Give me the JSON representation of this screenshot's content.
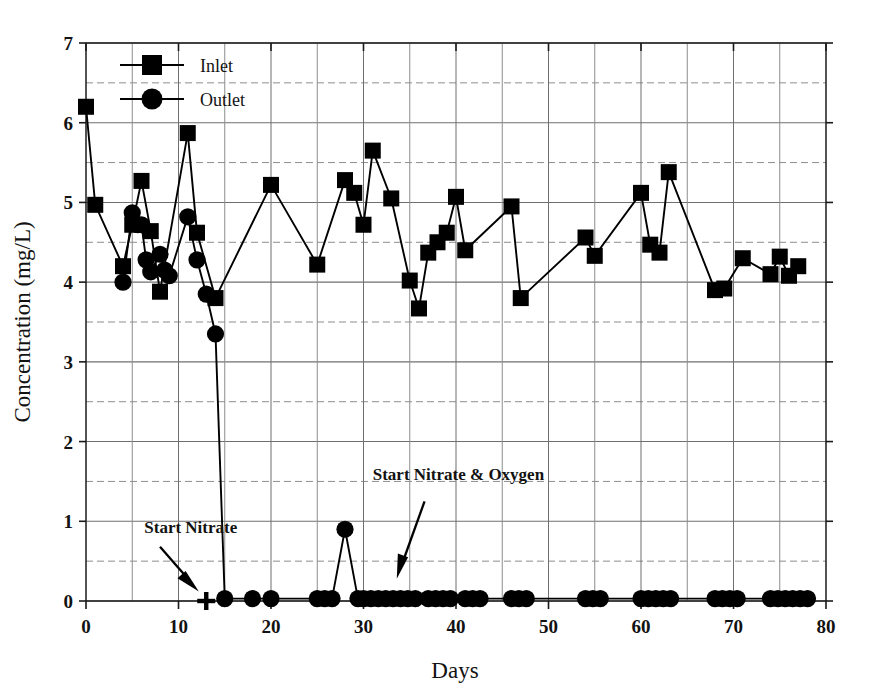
{
  "chart_data": {
    "type": "line",
    "title": "",
    "xlabel": "Days",
    "ylabel": "Concentration (mg/L)",
    "xlim": [
      0,
      80
    ],
    "ylim": [
      0,
      7
    ],
    "x_major_ticks": [
      0,
      10,
      20,
      30,
      40,
      50,
      60,
      70,
      80
    ],
    "x_minor_step": 5,
    "y_major_ticks": [
      0,
      1,
      2,
      3,
      4,
      5,
      6,
      7
    ],
    "y_minor_step": 0.5,
    "grid": "major solid, minor dashed",
    "legend_position": "top-left inside plot",
    "series": [
      {
        "name": "Inlet",
        "marker": "square",
        "color": "#000000",
        "points": [
          [
            0,
            6.2
          ],
          [
            1,
            4.97
          ],
          [
            4,
            4.2
          ],
          [
            5,
            4.72
          ],
          [
            6,
            5.27
          ],
          [
            7,
            4.64
          ],
          [
            8,
            3.88
          ],
          [
            11,
            5.87
          ],
          [
            12,
            4.62
          ],
          [
            14,
            3.8
          ],
          [
            20,
            5.22
          ],
          [
            25,
            4.22
          ],
          [
            28,
            5.28
          ],
          [
            29,
            5.12
          ],
          [
            30,
            4.72
          ],
          [
            31,
            5.65
          ],
          [
            33,
            5.05
          ],
          [
            35,
            4.02
          ],
          [
            36,
            3.67
          ],
          [
            37,
            4.37
          ],
          [
            38,
            4.5
          ],
          [
            39,
            4.62
          ],
          [
            40,
            5.07
          ],
          [
            41,
            4.4
          ],
          [
            46,
            4.95
          ],
          [
            47,
            3.8
          ],
          [
            54,
            4.56
          ],
          [
            55,
            4.33
          ],
          [
            60,
            5.12
          ],
          [
            61,
            4.47
          ],
          [
            62,
            4.37
          ],
          [
            63,
            5.38
          ],
          [
            68,
            3.9
          ],
          [
            69,
            3.92
          ],
          [
            71,
            4.3
          ],
          [
            74,
            4.1
          ],
          [
            75,
            4.32
          ],
          [
            76,
            4.08
          ],
          [
            77,
            4.2
          ]
        ]
      },
      {
        "name": "Outlet",
        "marker": "circle",
        "color": "#000000",
        "points": [
          [
            4,
            4.0
          ],
          [
            5,
            4.87
          ],
          [
            5.6,
            4.72
          ],
          [
            6,
            4.72
          ],
          [
            6.5,
            4.28
          ],
          [
            7,
            4.13
          ],
          [
            8,
            4.35
          ],
          [
            8.5,
            4.15
          ],
          [
            9,
            4.08
          ],
          [
            11,
            4.82
          ],
          [
            12,
            4.28
          ],
          [
            13,
            3.85
          ],
          [
            14,
            3.35
          ],
          [
            15,
            0.03
          ],
          [
            18,
            0.03
          ],
          [
            20,
            0.03
          ],
          [
            25,
            0.03
          ],
          [
            25.8,
            0.03
          ],
          [
            26.6,
            0.03
          ],
          [
            28,
            0.9
          ],
          [
            29.4,
            0.03
          ],
          [
            30,
            0.03
          ],
          [
            30.8,
            0.03
          ],
          [
            31.6,
            0.03
          ],
          [
            32.4,
            0.03
          ],
          [
            33.2,
            0.03
          ],
          [
            34,
            0.03
          ],
          [
            34.8,
            0.03
          ],
          [
            35.6,
            0.03
          ],
          [
            37,
            0.03
          ],
          [
            37.8,
            0.03
          ],
          [
            38.6,
            0.03
          ],
          [
            39.4,
            0.03
          ],
          [
            41,
            0.03
          ],
          [
            41.8,
            0.03
          ],
          [
            42.6,
            0.03
          ],
          [
            46,
            0.03
          ],
          [
            46.8,
            0.03
          ],
          [
            47.6,
            0.03
          ],
          [
            54,
            0.03
          ],
          [
            54.8,
            0.03
          ],
          [
            55.6,
            0.03
          ],
          [
            60,
            0.03
          ],
          [
            60.8,
            0.03
          ],
          [
            61.6,
            0.03
          ],
          [
            62.4,
            0.03
          ],
          [
            63.2,
            0.03
          ],
          [
            68,
            0.03
          ],
          [
            68.8,
            0.03
          ],
          [
            69.6,
            0.03
          ],
          [
            70.4,
            0.03
          ],
          [
            74,
            0.03
          ],
          [
            74.8,
            0.03
          ],
          [
            75.6,
            0.03
          ],
          [
            76.4,
            0.03
          ],
          [
            77.2,
            0.03
          ],
          [
            78,
            0.03
          ]
        ]
      }
    ],
    "markers": [
      {
        "name": "plus-marker",
        "symbol": "+",
        "x": 13,
        "y": 0.0
      }
    ],
    "annotations": [
      {
        "text": "Start Nitrate",
        "label_x": 6.3,
        "label_y": 0.85,
        "arrow_from_x": 8.0,
        "arrow_from_y": 0.68,
        "arrow_to_x": 12.2,
        "arrow_to_y": 0.12
      },
      {
        "text": "Start Nitrate & Oxygen",
        "label_x": 31.0,
        "label_y": 1.52,
        "arrow_from_x": 36.6,
        "arrow_from_y": 1.25,
        "arrow_to_x": 33.6,
        "arrow_to_y": 0.28
      }
    ],
    "legend": [
      {
        "label": "Inlet",
        "marker": "square"
      },
      {
        "label": "Outlet",
        "marker": "circle"
      }
    ],
    "xtick_labels": [
      "0",
      "10",
      "20",
      "30",
      "40",
      "50",
      "60",
      "70",
      "80"
    ],
    "ytick_labels": [
      "0",
      "1",
      "2",
      "3",
      "4",
      "5",
      "6",
      "7"
    ]
  }
}
